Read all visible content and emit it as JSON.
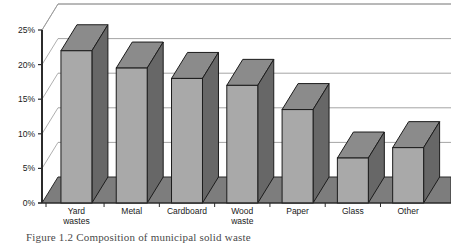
{
  "chart_data": {
    "type": "bar",
    "title": "",
    "subtitle": "",
    "xlabel": "",
    "ylabel": "",
    "categories": [
      "Yard wastes",
      "Metal",
      "Cardboard",
      "Wood waste",
      "Paper",
      "Glass",
      "Other"
    ],
    "category_lines": [
      [
        "Yard",
        "wastes"
      ],
      [
        "Metal"
      ],
      [
        "Cardboard"
      ],
      [
        "Wood",
        "waste"
      ],
      [
        "Paper"
      ],
      [
        "Glass"
      ],
      [
        "Other"
      ]
    ],
    "values": [
      22,
      19.5,
      18,
      17,
      13.5,
      6.5,
      8
    ],
    "ylim": [
      0,
      25
    ],
    "ytick_values": [
      0,
      5,
      10,
      15,
      20,
      25
    ],
    "ytick_labels": [
      "0%",
      "5%",
      "10%",
      "15%",
      "20%",
      "25%"
    ],
    "grid": true,
    "legend": "none",
    "style": "3d-column",
    "annotations": []
  },
  "colors": {
    "bar_front": "#a9a9a9",
    "bar_side": "#676767",
    "bar_top": "#8b8b8b",
    "bar_outline": "#1c1c1c",
    "floor": "#7d7d7d",
    "floor_edge": "#2b2b2b",
    "gridline": "#9a9a9a",
    "axis": "#2b2b2b",
    "background": "#ffffff",
    "text": "#1a1a1a",
    "caption": "#4a4a4a"
  },
  "caption": {
    "text": "Figure 1.2  Composition of municipal solid waste"
  }
}
